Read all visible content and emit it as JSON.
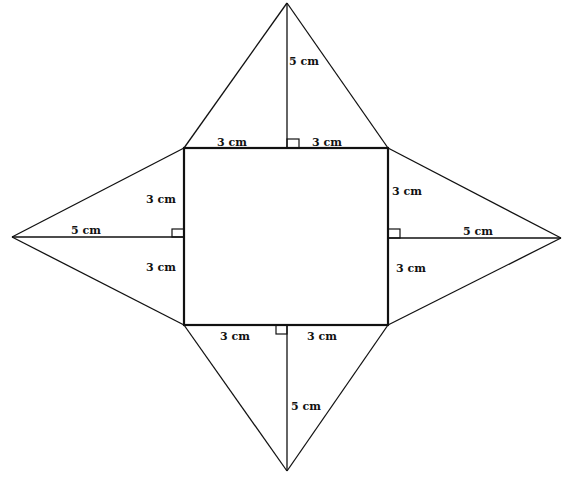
{
  "diagram": {
    "type": "net-of-square-pyramid",
    "base": {
      "shape": "square",
      "side_halves": [
        "3 cm",
        "3 cm"
      ]
    },
    "faces": [
      {
        "position": "top",
        "height_label": "5 cm",
        "base_left_label": "3 cm",
        "base_right_label": "3 cm"
      },
      {
        "position": "left",
        "height_label": "5 cm",
        "base_upper_label": "3 cm",
        "base_lower_label": "3 cm"
      },
      {
        "position": "right",
        "height_label": "5 cm",
        "base_upper_label": "3 cm",
        "base_lower_label": "3 cm"
      },
      {
        "position": "bottom",
        "height_label": "5 cm",
        "base_left_label": "3 cm",
        "base_right_label": "3 cm"
      }
    ],
    "colors": {
      "line": "#111111",
      "background": "#ffffff"
    }
  }
}
